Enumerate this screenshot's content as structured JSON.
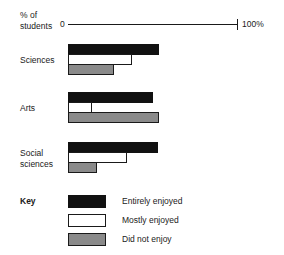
{
  "chart_data": {
    "type": "bar",
    "orientation": "horizontal",
    "title": "",
    "xlabel": "% of students",
    "ylabel": "",
    "xlim": [
      0,
      100
    ],
    "grid": false,
    "legend_position": "bottom-left",
    "axis": {
      "caption_line1": "% of",
      "caption_line2": "students",
      "min_tick_label": "0",
      "max_tick_label": "100%"
    },
    "legend_title": "Key",
    "categories": [
      "Sciences",
      "Arts",
      "Social sciences"
    ],
    "series": [
      {
        "name": "Entirely enjoyed",
        "color": "#111111",
        "values": [
          54,
          50,
          53
        ]
      },
      {
        "name": "Mostly enjoyed",
        "color": "#ffffff",
        "values": [
          38,
          14,
          35
        ]
      },
      {
        "name": "Did not enjoy",
        "color": "#8a8a8a",
        "values": [
          27,
          54,
          17
        ]
      }
    ]
  },
  "groups": [
    {
      "label_line1": "Sciences",
      "label_line2": "",
      "bars": [
        {
          "series": "Entirely enjoyed",
          "value": 54
        },
        {
          "series": "Mostly enjoyed",
          "value": 38
        },
        {
          "series": "Did not enjoy",
          "value": 27
        }
      ]
    },
    {
      "label_line1": "Arts",
      "label_line2": "",
      "bars": [
        {
          "series": "Entirely enjoyed",
          "value": 50
        },
        {
          "series": "Mostly enjoyed",
          "value": 14
        },
        {
          "series": "Did not enjoy",
          "value": 54
        }
      ]
    },
    {
      "label_line1": "Social",
      "label_line2": "sciences",
      "bars": [
        {
          "series": "Entirely enjoyed",
          "value": 53
        },
        {
          "series": "Mostly enjoyed",
          "value": 35
        },
        {
          "series": "Did not enjoy",
          "value": 17
        }
      ]
    }
  ],
  "legend": {
    "title": "Key",
    "items": [
      {
        "label": "Entirely enjoyed",
        "swatch": "entirely"
      },
      {
        "label": "Mostly enjoyed",
        "swatch": "mostly"
      },
      {
        "label": "Did not enjoy",
        "swatch": "didnot"
      }
    ]
  }
}
